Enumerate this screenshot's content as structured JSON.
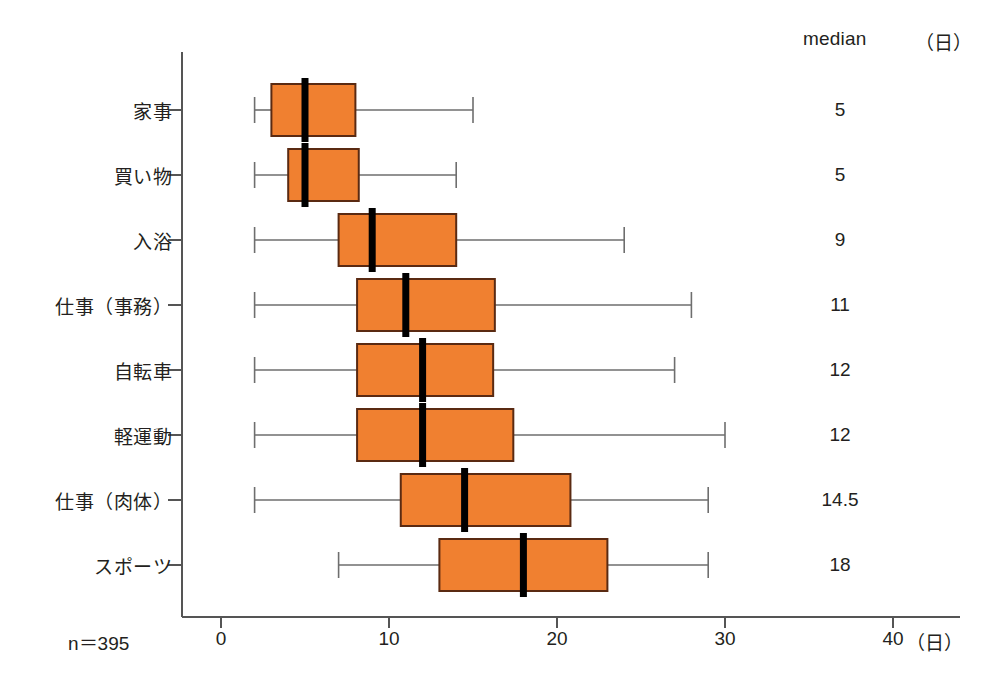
{
  "header": {
    "median_label": "median",
    "unit_label": "（日）"
  },
  "footer": {
    "sample_size": "n＝395",
    "axis_unit": "（日）"
  },
  "colors": {
    "box_fill": "#F08030",
    "box_stroke": "#5A2A12",
    "median_line": "#000000",
    "whisker": "#6E6E6E",
    "axis": "#555555",
    "text": "#231F20"
  },
  "chart_data": {
    "type": "box",
    "orientation": "horizontal",
    "title": "",
    "xlabel": "（日）",
    "ylabel": "",
    "xlim": [
      0,
      42
    ],
    "xticks": [
      0,
      10,
      20,
      30,
      40
    ],
    "xtick_labels": [
      "0",
      "10",
      "20",
      "30",
      "40"
    ],
    "grid": false,
    "legend": false,
    "annotations": [
      "n＝395",
      "median （日）"
    ],
    "categories": [
      "家事",
      "買い物",
      "入浴",
      "仕事（事務）",
      "自転車",
      "軽運動",
      "仕事（肉体）",
      "スポーツ"
    ],
    "medians": [
      5,
      5,
      9,
      11,
      12,
      12,
      14.5,
      18
    ],
    "median_labels": [
      "5",
      "5",
      "9",
      "11",
      "12",
      "12",
      "14.5",
      "18"
    ],
    "boxes": [
      {
        "category": "家事",
        "whisker_low": 2,
        "q1": 3,
        "median": 5,
        "q3": 8,
        "whisker_high": 15
      },
      {
        "category": "買い物",
        "whisker_low": 2,
        "q1": 4,
        "median": 5,
        "q3": 8.2,
        "whisker_high": 14
      },
      {
        "category": "入浴",
        "whisker_low": 2,
        "q1": 7,
        "median": 9,
        "q3": 14,
        "whisker_high": 24
      },
      {
        "category": "仕事（事務）",
        "whisker_low": 2,
        "q1": 8.1,
        "median": 11,
        "q3": 16.3,
        "whisker_high": 28
      },
      {
        "category": "自転車",
        "whisker_low": 2,
        "q1": 8.1,
        "median": 12,
        "q3": 16.2,
        "whisker_high": 27
      },
      {
        "category": "軽運動",
        "whisker_low": 2,
        "q1": 8.1,
        "median": 12,
        "q3": 17.4,
        "whisker_high": 30
      },
      {
        "category": "仕事（肉体）",
        "whisker_low": 2,
        "q1": 10.7,
        "median": 14.5,
        "q3": 20.8,
        "whisker_high": 29
      },
      {
        "category": "スポーツ",
        "whisker_low": 7,
        "q1": 13,
        "median": 18,
        "q3": 23,
        "whisker_high": 29
      }
    ]
  }
}
